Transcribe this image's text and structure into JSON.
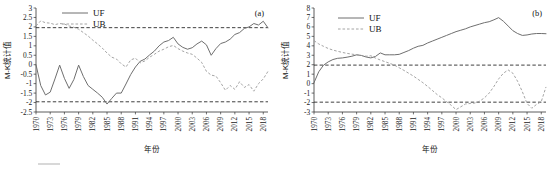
{
  "figure": {
    "panel_a_tag": "(a)",
    "panel_b_tag": "(b)"
  },
  "legend": {
    "uf_label": "UF",
    "ub_label": "UB"
  },
  "axis_titles": {
    "x": "年份",
    "y": "M-K统计值"
  },
  "colors": {
    "uf": "#6f6f6f",
    "ub": "#9a9a9a",
    "significance": "#1d1d1d",
    "axis": "#333333",
    "background": "#ffffff"
  },
  "chart_data": [
    {
      "type": "line",
      "title": "(a)",
      "xlabel": "年份",
      "ylabel": "M-K统计值",
      "xlim": [
        1970,
        2019
      ],
      "ylim": [
        -2.5,
        3
      ],
      "yticks": [
        -2.5,
        -2,
        -1.5,
        -1,
        -0.5,
        0,
        0.5,
        1,
        1.5,
        2,
        2.5,
        3
      ],
      "ytick_labels": [
        "-2.5",
        "-2",
        "-1.5",
        "-1",
        "-0.5",
        "0",
        "0.5",
        "1",
        "1.5",
        "2",
        "2.5",
        "3"
      ],
      "xticks": [
        1970,
        1973,
        1976,
        1979,
        1982,
        1985,
        1988,
        1991,
        1994,
        1997,
        2000,
        2003,
        2006,
        2009,
        2012,
        2015,
        2018
      ],
      "xtick_labels": [
        "1970",
        "1973",
        "1976",
        "1979",
        "1982",
        "1985",
        "1988",
        "1991",
        "1994",
        "1997",
        "2000",
        "2003",
        "2006",
        "2009",
        "2012",
        "2015",
        "2018"
      ],
      "grid": false,
      "legend_position": "top-center",
      "significance_lines": [
        1.96,
        -1.96
      ],
      "x": [
        1970,
        1971,
        1972,
        1973,
        1974,
        1975,
        1976,
        1977,
        1978,
        1979,
        1980,
        1981,
        1982,
        1983,
        1984,
        1985,
        1986,
        1987,
        1988,
        1989,
        1990,
        1991,
        1992,
        1993,
        1994,
        1995,
        1996,
        1997,
        1998,
        1999,
        2000,
        2001,
        2002,
        2003,
        2004,
        2005,
        2006,
        2007,
        2008,
        2009,
        2010,
        2011,
        2012,
        2013,
        2014,
        2015,
        2016,
        2017,
        2018,
        2019
      ],
      "series": [
        {
          "name": "UF",
          "style": "solid",
          "values": [
            0.0,
            -1.1,
            -1.6,
            -1.45,
            -0.75,
            -0.02,
            -0.72,
            -1.25,
            -0.78,
            -0.02,
            -0.62,
            -1.1,
            -1.3,
            -1.5,
            -1.72,
            -2.08,
            -1.78,
            -1.5,
            -1.5,
            -1.02,
            -0.52,
            -0.12,
            0.18,
            0.3,
            0.52,
            0.72,
            1.0,
            1.2,
            1.28,
            1.45,
            1.1,
            0.92,
            0.82,
            0.9,
            1.1,
            1.25,
            1.05,
            0.5,
            0.85,
            1.12,
            1.2,
            1.35,
            1.6,
            1.7,
            1.92,
            2.0,
            2.18,
            2.1,
            2.3,
            1.95
          ]
        },
        {
          "name": "UB",
          "style": "dashed",
          "values": [
            2.05,
            2.32,
            2.22,
            2.2,
            2.12,
            2.18,
            2.15,
            2.05,
            1.98,
            1.88,
            1.7,
            1.52,
            1.3,
            1.1,
            0.88,
            0.62,
            0.4,
            0.3,
            0.05,
            -0.12,
            0.25,
            0.35,
            0.1,
            0.2,
            0.4,
            0.55,
            0.72,
            0.82,
            0.95,
            1.02,
            0.85,
            0.72,
            0.62,
            0.55,
            0.35,
            0.12,
            -0.35,
            -0.55,
            -0.6,
            -0.95,
            -1.35,
            -1.1,
            -1.3,
            -0.9,
            -1.2,
            -1.05,
            -1.4,
            -1.0,
            -0.75,
            -0.35
          ]
        }
      ]
    },
    {
      "type": "line",
      "title": "(b)",
      "xlabel": "年份",
      "ylabel": "M-K统计值",
      "xlim": [
        1970,
        2019
      ],
      "ylim": [
        -3,
        8
      ],
      "yticks": [
        -3,
        -2,
        -1,
        0,
        1,
        2,
        3,
        4,
        5,
        6,
        7,
        8
      ],
      "ytick_labels": [
        "-3",
        "-2",
        "-1",
        "0",
        "1",
        "2",
        "3",
        "4",
        "5",
        "6",
        "7",
        "8"
      ],
      "xticks": [
        1970,
        1973,
        1976,
        1979,
        1982,
        1985,
        1988,
        1991,
        1994,
        1997,
        2000,
        2003,
        2006,
        2009,
        2012,
        2015,
        2018
      ],
      "xtick_labels": [
        "1970",
        "1973",
        "1976",
        "1979",
        "1982",
        "1985",
        "1988",
        "1991",
        "1994",
        "1997",
        "2000",
        "2003",
        "2006",
        "2009",
        "2012",
        "2015",
        "2018"
      ],
      "grid": false,
      "legend_position": "top-center",
      "significance_lines": [
        1.96,
        -1.96
      ],
      "x": [
        1970,
        1971,
        1972,
        1973,
        1974,
        1975,
        1976,
        1977,
        1978,
        1979,
        1980,
        1981,
        1982,
        1983,
        1984,
        1985,
        1986,
        1987,
        1988,
        1989,
        1990,
        1991,
        1992,
        1993,
        1994,
        1995,
        1996,
        1997,
        1998,
        1999,
        2000,
        2001,
        2002,
        2003,
        2004,
        2005,
        2006,
        2007,
        2008,
        2009,
        2010,
        2011,
        2012,
        2013,
        2014,
        2015,
        2016,
        2017,
        2018,
        2019
      ],
      "series": [
        {
          "name": "UF",
          "style": "solid",
          "values": [
            0.1,
            1.25,
            1.95,
            2.3,
            2.55,
            2.68,
            2.72,
            2.8,
            2.9,
            3.05,
            2.98,
            2.82,
            2.72,
            2.88,
            3.25,
            3.05,
            3.05,
            3.05,
            3.1,
            3.3,
            3.5,
            3.75,
            3.95,
            4.05,
            4.3,
            4.5,
            4.7,
            4.9,
            5.1,
            5.3,
            5.5,
            5.65,
            5.8,
            6.0,
            6.15,
            6.3,
            6.45,
            6.55,
            6.75,
            6.98,
            6.6,
            6.1,
            5.6,
            5.3,
            5.1,
            5.15,
            5.25,
            5.3,
            5.3,
            5.28
          ]
        },
        {
          "name": "UB",
          "style": "dashed",
          "values": [
            4.55,
            4.2,
            3.95,
            3.72,
            3.55,
            3.42,
            3.3,
            3.2,
            3.12,
            3.05,
            2.98,
            2.9,
            2.95,
            2.7,
            2.5,
            2.32,
            2.15,
            1.95,
            1.68,
            1.4,
            1.1,
            0.8,
            0.45,
            0.1,
            -0.3,
            -0.72,
            -1.15,
            -1.5,
            -1.9,
            -2.3,
            -2.75,
            -2.45,
            -2.15,
            -2.1,
            -2.05,
            -1.85,
            -1.5,
            -1.0,
            -0.3,
            0.5,
            1.1,
            1.45,
            1.1,
            0.25,
            -0.85,
            -2.1,
            -2.6,
            -2.2,
            -1.9,
            -0.35
          ]
        }
      ]
    }
  ]
}
